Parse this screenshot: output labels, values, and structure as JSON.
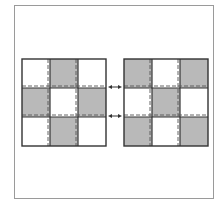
{
  "diagram": {
    "colors": {
      "fill": "#b9b9b9",
      "empty": "#ffffff",
      "line": "#333333",
      "dash": "#555555",
      "frame": "#9a9a9a"
    },
    "grids": [
      {
        "name": "left-grid",
        "rows": 3,
        "cols": 3,
        "shaded": [
          [
            0,
            1,
            0
          ],
          [
            1,
            0,
            1
          ],
          [
            0,
            1,
            0
          ]
        ]
      },
      {
        "name": "right-grid",
        "rows": 3,
        "cols": 3,
        "shaded": [
          [
            1,
            0,
            1
          ],
          [
            0,
            1,
            0
          ],
          [
            1,
            0,
            1
          ]
        ]
      }
    ],
    "arrows": [
      {
        "name": "arrow-upper",
        "type": "double-headed",
        "connects_row_boundary": 1
      },
      {
        "name": "arrow-lower",
        "type": "double-headed",
        "connects_row_boundary": 2
      }
    ]
  }
}
